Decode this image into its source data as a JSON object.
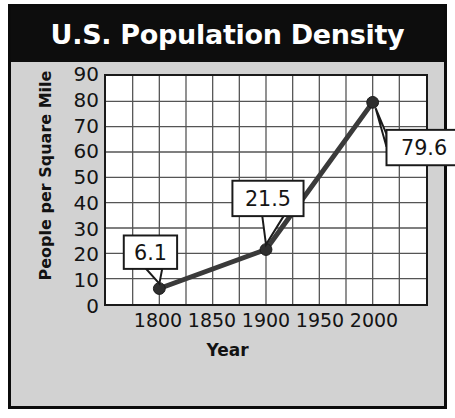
{
  "chart_data": {
    "type": "line",
    "title": "U.S. Population Density",
    "xlabel": "Year",
    "ylabel": "People per Square Mile",
    "x": [
      1800,
      1900,
      2000
    ],
    "values": [
      6.1,
      21.5,
      79.6
    ],
    "point_labels": [
      "6.1",
      "21.5",
      "79.6"
    ],
    "xlim": [
      1750,
      2050
    ],
    "ylim": [
      0,
      90
    ],
    "xticks": [
      "1800",
      "1850",
      "1900",
      "1950",
      "2000"
    ],
    "xtick_values": [
      1800,
      1850,
      1900,
      1950,
      2000
    ],
    "yticks": [
      "0",
      "10",
      "20",
      "30",
      "40",
      "50",
      "60",
      "70",
      "80",
      "90"
    ],
    "ytick_values": [
      0,
      10,
      20,
      30,
      40,
      50,
      60,
      70,
      80,
      90
    ],
    "grid": true,
    "grid_columns": 12,
    "grid_rows": 9,
    "legend": null,
    "series": [
      {
        "name": "U.S. Population Density",
        "x": [
          1800,
          1900,
          2000
        ],
        "values": [
          6.1,
          21.5,
          79.6
        ]
      }
    ],
    "colors": {
      "title_background": "#0d0d0d",
      "title_text": "#ffffff",
      "figure_background": "#d2d2d2",
      "plot_background": "#ffffff",
      "line": "#3a3a3a",
      "marker": "#2e2e2e",
      "grid": "#555555",
      "axis_text": "#141414",
      "border": "#0b0b0b"
    }
  }
}
